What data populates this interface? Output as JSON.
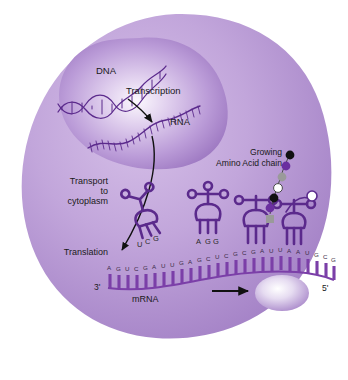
{
  "figure": {
    "labels": {
      "dna": "DNA",
      "transcription": "Transcription",
      "rna": "RNA",
      "transport": "Transport\nto\ncytoplasm",
      "translation": "Translation",
      "growing": "Growing",
      "amino_acid_chain": "Amino Acid chain",
      "mrna": "mRNA",
      "three_prime": "3'",
      "five_prime": "5'"
    },
    "trna_anticodons": [
      {
        "id": "trna-free-left",
        "bases": [
          "U",
          "C",
          "G"
        ]
      },
      {
        "id": "trna-free-middle",
        "bases": [
          "A",
          "G",
          "G"
        ]
      }
    ],
    "mrna_sequence": [
      "A",
      "G",
      "U",
      "C",
      "G",
      "A",
      "U",
      "U",
      "G",
      "A",
      "G",
      "C",
      "U",
      "C",
      "G",
      "C",
      "G",
      "A",
      "U",
      "U",
      "A",
      "A",
      "U",
      "G",
      "C",
      "G"
    ],
    "amino_acid_beads": [
      "#111111",
      "#6b2fa0",
      "#9a9a9a",
      "#ffffff",
      "#111111",
      "#6b2fa0",
      "#9a9a9a"
    ],
    "colors": {
      "background": "#ffffff",
      "cytoplasm_light": "#cdb3e2",
      "cytoplasm_mid": "#b79ad3",
      "cytoplasm_dark": "#9a77bd",
      "nucleus_center": "#f6f1fa",
      "nucleus_edge": "#9d79c0",
      "molecule_stroke": "#5b2a8c",
      "mrna_bar": "#7b3fa8",
      "arrow": "#111111",
      "text": "#1a1a1a"
    }
  },
  "footer": {
    "page_number": "47",
    "caption": "Gene Expression"
  }
}
